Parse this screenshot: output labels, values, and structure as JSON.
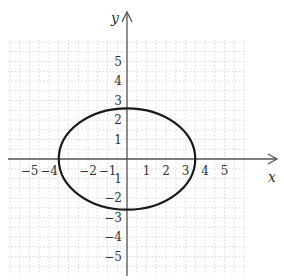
{
  "chart_data": {
    "type": "line",
    "title": "",
    "xlabel": "x",
    "ylabel": "y",
    "xlim": [
      -6,
      6
    ],
    "ylim": [
      -6,
      6
    ],
    "grid": true,
    "grid_style": "dotted",
    "x_tick_labels": [
      {
        "value": -5,
        "label": "−5"
      },
      {
        "value": -4,
        "label": "−4"
      },
      {
        "value": -2,
        "label": "−2"
      },
      {
        "value": -1,
        "label": "−1"
      },
      {
        "value": 1,
        "label": "1"
      },
      {
        "value": 2,
        "label": "2"
      },
      {
        "value": 3,
        "label": "3"
      },
      {
        "value": 4,
        "label": "4"
      },
      {
        "value": 5,
        "label": "5"
      }
    ],
    "y_tick_labels": [
      {
        "value": 5,
        "label": "5"
      },
      {
        "value": 4,
        "label": "4"
      },
      {
        "value": 3,
        "label": "3"
      },
      {
        "value": 2,
        "label": "2"
      },
      {
        "value": 1,
        "label": "1"
      },
      {
        "value": -1,
        "label": "1"
      },
      {
        "value": -2,
        "label": "−2"
      },
      {
        "value": -3,
        "label": "−3"
      },
      {
        "value": -4,
        "label": "−4"
      },
      {
        "value": -5,
        "label": "−5"
      }
    ],
    "series": [
      {
        "name": "closed curve",
        "shape": "ellipse",
        "center": [
          0,
          0
        ],
        "semi_axis_x_approx": 3.5,
        "semi_axis_y_approx": 2.6,
        "extents_note": "Semi-axes estimated from pixel positions; no equation or labeled intercepts are shown on the chart."
      }
    ],
    "colors": {
      "axis": "#555555",
      "curve": "#1a1a1a",
      "grid": "#d8d8d8",
      "text": "#333333"
    }
  },
  "labels": {
    "x_axis": "x",
    "y_axis": "y"
  }
}
